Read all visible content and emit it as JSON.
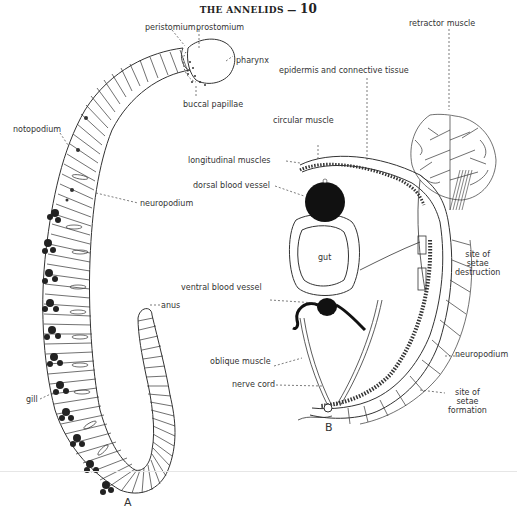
{
  "header": {
    "title": "THE ANNELIDS",
    "dash": "—",
    "page_number": "10"
  },
  "figure_a": {
    "panel_label": "A",
    "labels": {
      "peristomium": "peristomium",
      "prostomium": "prostomium",
      "pharynx": "pharynx",
      "buccal_papillae": "buccal papillae",
      "notopodium": "notopodium",
      "neuropodium": "neuropodium",
      "anus": "anus",
      "gill": "gill"
    }
  },
  "figure_b": {
    "panel_label": "B",
    "labels": {
      "epidermis": "epidermis and connective tissue",
      "retractor_muscle": "retractor muscle",
      "circular_muscle": "circular muscle",
      "longitudinal_muscles": "longitudinal muscles",
      "dorsal_blood_vessel": "dorsal blood vessel",
      "gut": "gut",
      "ventral_blood_vessel": "ventral blood vessel",
      "oblique_muscle": "oblique muscle",
      "nerve_cord": "nerve cord",
      "site_setae_destruction": [
        "site of",
        "setae",
        "destruction"
      ],
      "neuropodium": "neuropodium",
      "site_setae_formation": [
        "site of",
        "setae",
        "formation"
      ]
    }
  }
}
